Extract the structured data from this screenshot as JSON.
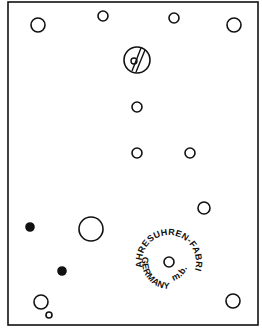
{
  "diagram": {
    "colors": {
      "line": "#111111",
      "background": "#ffffff"
    },
    "plate": {
      "x": 8,
      "y": 2,
      "width": 250,
      "height": 323
    },
    "holes": [
      {
        "id": "top-left-pillar",
        "cx": 38,
        "cy": 25,
        "r": 7,
        "filled": false
      },
      {
        "id": "top-small-left",
        "cx": 103,
        "cy": 16,
        "r": 5,
        "filled": false
      },
      {
        "id": "top-small-right",
        "cx": 174,
        "cy": 18,
        "r": 5,
        "filled": false
      },
      {
        "id": "top-right-pillar",
        "cx": 234,
        "cy": 25,
        "r": 7,
        "filled": false
      },
      {
        "id": "upper-center-1",
        "cx": 137,
        "cy": 107,
        "r": 5,
        "filled": false
      },
      {
        "id": "middle-center",
        "cx": 137,
        "cy": 153,
        "r": 5,
        "filled": false
      },
      {
        "id": "middle-right",
        "cx": 190,
        "cy": 153,
        "r": 5,
        "filled": false
      },
      {
        "id": "right-lower",
        "cx": 204,
        "cy": 208,
        "r": 6,
        "filled": false
      },
      {
        "id": "large-arbor",
        "cx": 91,
        "cy": 229,
        "r": 12,
        "filled": false
      },
      {
        "id": "dot-upper",
        "cx": 30,
        "cy": 227,
        "r": 4,
        "filled": true
      },
      {
        "id": "dot-lower",
        "cx": 62,
        "cy": 271,
        "r": 4,
        "filled": true
      },
      {
        "id": "stamp-center",
        "cx": 169,
        "cy": 262,
        "r": 5,
        "filled": false
      },
      {
        "id": "bottom-left-pillar",
        "cx": 41,
        "cy": 302,
        "r": 7,
        "filled": false
      },
      {
        "id": "bottom-left-small",
        "cx": 49,
        "cy": 315,
        "r": 3,
        "filled": false
      },
      {
        "id": "bottom-right-pillar",
        "cx": 233,
        "cy": 301,
        "r": 7,
        "filled": false
      }
    ],
    "slotted_hole": {
      "cx": 137,
      "cy": 60,
      "r": 13
    },
    "stamp": {
      "top_text": "JAHRESUHREN-FABRIK",
      "bottom_left_text": "GERMANY",
      "bottom_right_text": "G.m.b.H.",
      "cx": 169,
      "cy": 262,
      "text_radius": 27
    }
  }
}
